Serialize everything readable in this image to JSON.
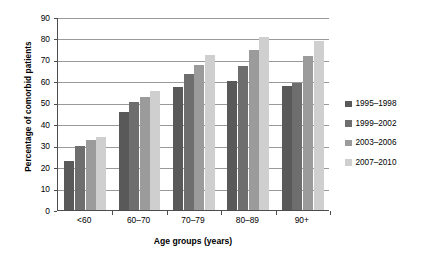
{
  "chart_data": {
    "type": "bar",
    "title": "",
    "xlabel": "Age groups (years)",
    "ylabel": "Percentage of comorbid patients",
    "categories": [
      "<60",
      "60–70",
      "70–79",
      "80–89",
      "90+"
    ],
    "series": [
      {
        "name": "1995–1998",
        "color": "#595959",
        "values": [
          23,
          45.5,
          57.5,
          60,
          58
        ]
      },
      {
        "name": "1999–2002",
        "color": "#6e6e6e",
        "values": [
          30,
          50.5,
          63.5,
          67,
          59
        ]
      },
      {
        "name": "2003–2006",
        "color": "#9b9b9b",
        "values": [
          32.5,
          52.5,
          67.5,
          74.5,
          72
        ]
      },
      {
        "name": "2007–2010",
        "color": "#cfcfcf",
        "values": [
          34,
          55.5,
          72.5,
          80.5,
          79
        ]
      }
    ],
    "ylim": [
      0,
      90
    ],
    "yticks": [
      0,
      10,
      20,
      30,
      40,
      50,
      60,
      70,
      80,
      90
    ],
    "ytick_labels": [
      "0",
      "10",
      "20",
      "30",
      "40",
      "50",
      "60",
      "70",
      "80",
      "90"
    ],
    "grid": true,
    "legend_position": "right"
  }
}
